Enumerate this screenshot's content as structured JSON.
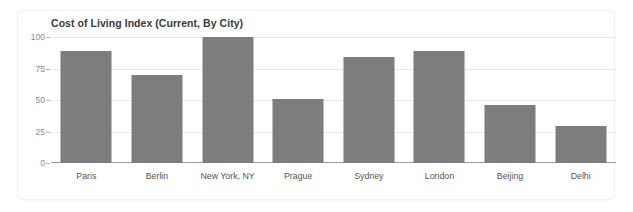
{
  "card": {
    "title": "Cost of Living Index (Current, By City)"
  },
  "chart_data": {
    "type": "bar",
    "title": "Cost of Living Index (Current, By City)",
    "xlabel": "",
    "ylabel": "",
    "categories": [
      "Paris",
      "Berlin",
      "New York, NY",
      "Prague",
      "Sydney",
      "London",
      "Beijing",
      "Delhi"
    ],
    "values": [
      89,
      70,
      100,
      51,
      84,
      89,
      46,
      29
    ],
    "ylim": [
      0,
      100
    ],
    "yticks": [
      0,
      25,
      50,
      75,
      100
    ],
    "ytick_labels": [
      "0",
      "25",
      "50",
      "75",
      "100"
    ],
    "grid": true,
    "legend": false,
    "bar_color": "#7d7d7d",
    "grid_color": "#e9e9e9",
    "axis_color": "#9a9a9a",
    "title_color": "#3a3a3a",
    "tick_label_color": "#8a8a8a",
    "category_label_color": "#555555",
    "background_color": "#ffffff"
  }
}
